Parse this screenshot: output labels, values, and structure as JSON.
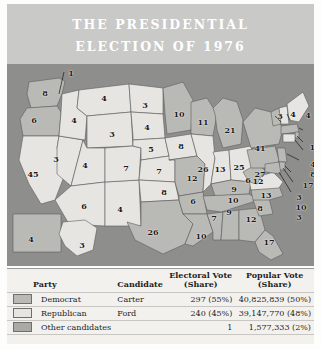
{
  "title": {
    "line1": "THE PRESIDENTIAL",
    "line2": "ELECTION OF 1976"
  },
  "colors": {
    "title_band": "#c9c9c7",
    "ocean": "#8e8e8c",
    "democrat": "#b9b9b5",
    "republican": "#e6e5e1",
    "other": "#a9a9a5",
    "legend_bg": "#f2f1ee",
    "label_text": "#1a1a1a"
  },
  "map": {
    "name": "united-states-electoral-map-1976",
    "state_labels": [
      {
        "state": "WA",
        "value": "8",
        "x": 38,
        "y": 29,
        "party": "democrat"
      },
      {
        "state": "OR",
        "value": "6",
        "x": 27,
        "y": 56,
        "party": "democrat"
      },
      {
        "state": "CA",
        "value": "45",
        "x": 26,
        "y": 110,
        "party": "republican"
      },
      {
        "state": "NV",
        "value": "3",
        "x": 49,
        "y": 95,
        "party": "republican"
      },
      {
        "state": "ID",
        "value": "4",
        "x": 67,
        "y": 56,
        "party": "republican"
      },
      {
        "state": "MT",
        "value": "4",
        "x": 97,
        "y": 34,
        "party": "republican"
      },
      {
        "state": "WY",
        "value": "3",
        "x": 105,
        "y": 70,
        "party": "republican"
      },
      {
        "state": "UT",
        "value": "4",
        "x": 78,
        "y": 101,
        "party": "republican"
      },
      {
        "state": "AZ",
        "value": "6",
        "x": 77,
        "y": 142,
        "party": "republican"
      },
      {
        "state": "NM",
        "value": "4",
        "x": 113,
        "y": 145,
        "party": "republican"
      },
      {
        "state": "CO",
        "value": "7",
        "x": 119,
        "y": 104,
        "party": "republican"
      },
      {
        "state": "ND",
        "value": "3",
        "x": 138,
        "y": 41,
        "party": "republican"
      },
      {
        "state": "SD",
        "value": "4",
        "x": 140,
        "y": 63,
        "party": "republican"
      },
      {
        "state": "NE",
        "value": "5",
        "x": 144,
        "y": 85,
        "party": "republican"
      },
      {
        "state": "KS",
        "value": "7",
        "x": 152,
        "y": 107,
        "party": "republican"
      },
      {
        "state": "OK",
        "value": "8",
        "x": 157,
        "y": 128,
        "party": "republican"
      },
      {
        "state": "TX",
        "value": "26",
        "x": 146,
        "y": 168,
        "party": "democrat"
      },
      {
        "state": "MN",
        "value": "10",
        "x": 172,
        "y": 50,
        "party": "democrat"
      },
      {
        "state": "IA",
        "value": "8",
        "x": 174,
        "y": 82,
        "party": "republican"
      },
      {
        "state": "MO",
        "value": "12",
        "x": 185,
        "y": 114,
        "party": "democrat"
      },
      {
        "state": "AR",
        "value": "6",
        "x": 186,
        "y": 137,
        "party": "democrat"
      },
      {
        "state": "LA",
        "value": "10",
        "x": 194,
        "y": 172,
        "party": "democrat"
      },
      {
        "state": "MS",
        "value": "7",
        "x": 207,
        "y": 154,
        "party": "democrat"
      },
      {
        "state": "AL",
        "value": "9",
        "x": 222,
        "y": 148,
        "party": "democrat"
      },
      {
        "state": "WI",
        "value": "11",
        "x": 196,
        "y": 58,
        "party": "democrat"
      },
      {
        "state": "IL",
        "value": "26",
        "x": 196,
        "y": 105,
        "party": "republican"
      },
      {
        "state": "IN",
        "value": "13",
        "x": 213,
        "y": 105,
        "party": "republican"
      },
      {
        "state": "MI",
        "value": "21",
        "x": 223,
        "y": 66,
        "party": "democrat"
      },
      {
        "state": "OH",
        "value": "25",
        "x": 232,
        "y": 103,
        "party": "republican"
      },
      {
        "state": "KY",
        "value": "9",
        "x": 227,
        "y": 125,
        "party": "democrat"
      },
      {
        "state": "TN",
        "value": "10",
        "x": 226,
        "y": 136,
        "party": "democrat"
      },
      {
        "state": "GA",
        "value": "12",
        "x": 244,
        "y": 155,
        "party": "democrat"
      },
      {
        "state": "SC",
        "value": "8",
        "x": 253,
        "y": 144,
        "party": "democrat"
      },
      {
        "state": "NC",
        "value": "13",
        "x": 259,
        "y": 131,
        "party": "democrat"
      },
      {
        "state": "VA",
        "value": "12",
        "x": 251,
        "y": 117,
        "party": "republican"
      },
      {
        "state": "WV",
        "value": "6",
        "x": 241,
        "y": 116,
        "party": "democrat"
      },
      {
        "state": "FL",
        "value": "17",
        "x": 262,
        "y": 178,
        "party": "democrat"
      },
      {
        "state": "PA",
        "value": "27",
        "x": 253,
        "y": 110,
        "party": "democrat"
      },
      {
        "state": "NY",
        "value": "41",
        "x": 253,
        "y": 84,
        "party": "democrat"
      },
      {
        "state": "VT",
        "value": "3",
        "x": 273,
        "y": 52,
        "party": "democrat"
      },
      {
        "state": "NH",
        "value": "4",
        "x": 286,
        "y": 50,
        "party": "republican"
      },
      {
        "state": "ME",
        "value": "4",
        "x": 301,
        "y": 51,
        "party": "republican"
      },
      {
        "state": "MA",
        "value": "14",
        "x": 308,
        "y": 83,
        "party": "democrat"
      },
      {
        "state": "RI",
        "value": "4",
        "x": 306,
        "y": 100,
        "party": "democrat"
      },
      {
        "state": "CT",
        "value": "8",
        "x": 306,
        "y": 110,
        "party": "republican"
      },
      {
        "state": "NJ",
        "value": "17",
        "x": 301,
        "y": 121,
        "party": "democrat"
      },
      {
        "state": "DE",
        "value": "3",
        "x": 292,
        "y": 133,
        "party": "democrat"
      },
      {
        "state": "MD",
        "value": "10",
        "x": 294,
        "y": 143,
        "party": "democrat"
      },
      {
        "state": "DC",
        "value": "3",
        "x": 292,
        "y": 153,
        "party": "democrat"
      },
      {
        "state": "AK",
        "value": "3",
        "x": 75,
        "y": 181,
        "party": "republican"
      },
      {
        "state": "HI",
        "value": "4",
        "x": 24,
        "y": 175,
        "party": "democrat"
      },
      {
        "state": "WA-split-elector",
        "value": "1",
        "x": 64,
        "y": 9,
        "party": "other"
      }
    ]
  },
  "legend": {
    "headers": {
      "party": "Party",
      "candidate": "Candidate",
      "electoral_line1": "Electoral Vote",
      "electoral_line2": "(Share)",
      "popular_line1": "Popular Vote",
      "popular_line2": "(Share)"
    },
    "rows": [
      {
        "party": "Democrat",
        "candidate": "Carter",
        "electoral": "297 (55%)",
        "popular": "40,825,839 (50%)",
        "swatch": "sw-dem"
      },
      {
        "party": "Republican",
        "candidate": "Ford",
        "electoral": "240 (45%)",
        "popular": "39,147,770 (48%)",
        "swatch": "sw-rep"
      },
      {
        "party": "Other candidates",
        "candidate": "",
        "electoral": "1",
        "popular": "1,577,333 (2%)",
        "swatch": "sw-oth"
      }
    ]
  }
}
